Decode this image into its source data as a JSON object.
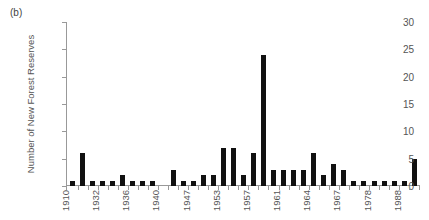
{
  "panel_label": "(b)",
  "chart_data": {
    "type": "bar",
    "title": "",
    "xlabel": "",
    "ylabel": "Number of New Forest Reserves",
    "ylim": [
      0,
      30
    ],
    "yticks": [
      0,
      5,
      10,
      15,
      20,
      25,
      30
    ],
    "grid": false,
    "legend": null,
    "xtick_labels": [
      "1910",
      "1932",
      "1936",
      "1940",
      "1947",
      "1953",
      "1957",
      "1961",
      "1964",
      "1967",
      "1978",
      "1988"
    ],
    "xtick_label_interval_bars": 3,
    "categories": [
      "1910",
      "b2",
      "b3",
      "1932",
      "b5",
      "b6",
      "1936",
      "b8",
      "b9",
      "1940",
      "b11",
      "b12",
      "1947",
      "b14",
      "b15",
      "1953",
      "b17",
      "b18",
      "1957",
      "b20",
      "b21",
      "1961",
      "b23",
      "b24",
      "1964",
      "b26",
      "b27",
      "1967",
      "b29",
      "b30",
      "1978",
      "b32",
      "b33",
      "1988",
      "b35"
    ],
    "values": [
      1,
      6,
      1,
      1,
      1,
      2,
      1,
      1,
      1,
      0,
      3,
      1,
      1,
      2,
      2,
      7,
      7,
      2,
      6,
      24,
      3,
      3,
      3,
      3,
      6,
      2,
      4,
      3,
      1,
      1,
      1,
      1,
      1,
      1,
      5
    ],
    "bar_color": "#111111",
    "axis_color": "#999999"
  }
}
